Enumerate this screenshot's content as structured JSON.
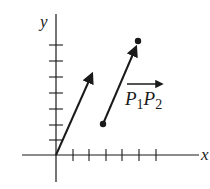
{
  "diagram": {
    "type": "vector-diagram",
    "axes": {
      "x_label": "x",
      "y_label": "y",
      "origin_px": [
        56,
        155
      ],
      "x_ticks_px": [
        73,
        89,
        106,
        122,
        139,
        156
      ],
      "y_ticks_px": [
        140,
        125,
        109,
        93,
        77,
        61,
        45
      ]
    },
    "position_vector": {
      "from_px": [
        56,
        155
      ],
      "to_px": [
        93,
        72
      ]
    },
    "displacement_vector": {
      "label_main_1": "P",
      "label_sub_1": "1",
      "label_main_2": "P",
      "label_sub_2": "2",
      "p1_px": [
        103,
        124
      ],
      "p2_px": [
        138,
        41
      ]
    },
    "colors": {
      "stroke": "#1a1a1a",
      "background": "#ffffff"
    }
  }
}
